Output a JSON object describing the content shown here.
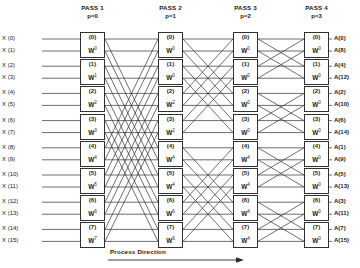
{
  "figure": {
    "caption": "Process Direction",
    "w_symbol": "W"
  },
  "passes": [
    {
      "name": "PASS 1",
      "index_label": "p=0",
      "boxes": [
        {
          "label": "(0)",
          "w_exp": "0"
        },
        {
          "label": "(1)",
          "w_exp": "1"
        },
        {
          "label": "(2)",
          "w_exp": "2"
        },
        {
          "label": "(3)",
          "w_exp": "3"
        },
        {
          "label": "(4)",
          "w_exp": "4"
        },
        {
          "label": "(5)",
          "w_exp": "5"
        },
        {
          "label": "(6)",
          "w_exp": "6"
        },
        {
          "label": "(7)",
          "w_exp": "7"
        }
      ]
    },
    {
      "name": "PASS 2",
      "index_label": "p=1",
      "boxes": [
        {
          "label": "(0)",
          "w_exp": "0"
        },
        {
          "label": "(1)",
          "w_exp": "0"
        },
        {
          "label": "(2)",
          "w_exp": "2"
        },
        {
          "label": "(3)",
          "w_exp": "2"
        },
        {
          "label": "(4)",
          "w_exp": "4"
        },
        {
          "label": "(5)",
          "w_exp": "4"
        },
        {
          "label": "(6)",
          "w_exp": "6"
        },
        {
          "label": "(7)",
          "w_exp": "6"
        }
      ]
    },
    {
      "name": "PASS 3",
      "index_label": "p=2",
      "boxes": [
        {
          "label": "(0)",
          "w_exp": "0"
        },
        {
          "label": "(1)",
          "w_exp": "0"
        },
        {
          "label": "(2)",
          "w_exp": "0"
        },
        {
          "label": "(3)",
          "w_exp": "0"
        },
        {
          "label": "(4)",
          "w_exp": "4"
        },
        {
          "label": "(5)",
          "w_exp": "4"
        },
        {
          "label": "(6)",
          "w_exp": "4"
        },
        {
          "label": "(7)",
          "w_exp": "4"
        }
      ]
    },
    {
      "name": "PASS 4",
      "index_label": "p=3",
      "boxes": [
        {
          "label": "(0)",
          "w_exp": "0"
        },
        {
          "label": "(1)",
          "w_exp": "0"
        },
        {
          "label": "(2)",
          "w_exp": "0"
        },
        {
          "label": "(3)",
          "w_exp": "0"
        },
        {
          "label": "(4)",
          "w_exp": "0"
        },
        {
          "label": "(5)",
          "w_exp": "0"
        },
        {
          "label": "(6)",
          "w_exp": "0"
        },
        {
          "label": "(7)",
          "w_exp": "0"
        }
      ]
    }
  ],
  "inputs": [
    "X (0)",
    "X (1)",
    "X (2)",
    "X (3)",
    "X (4)",
    "X (5)",
    "X (6)",
    "X (7)",
    "X (8)",
    "X (9)",
    "X (10)",
    "X (11)",
    "X (12)",
    "X (13)",
    "X (14)",
    "X (15)"
  ],
  "outputs": [
    "A(0)",
    "A(8)",
    "A(4)",
    "A(12)",
    "A(2)",
    "A(10)",
    "A(6)",
    "A(14)",
    "A(1)",
    "A(9)",
    "A(5)",
    "A(13)",
    "A(3)",
    "A(11)",
    "A(7)",
    "A(15)"
  ],
  "chart_data": {
    "type": "diagram",
    "n_points": 16,
    "n_passes": 4,
    "pass_strides": [
      8,
      4,
      2,
      1
    ],
    "twiddle_exponents": [
      [
        0,
        1,
        2,
        3,
        4,
        5,
        6,
        7
      ],
      [
        0,
        0,
        2,
        2,
        4,
        4,
        6,
        6
      ],
      [
        0,
        0,
        0,
        0,
        4,
        4,
        4,
        4
      ],
      [
        0,
        0,
        0,
        0,
        0,
        0,
        0,
        0
      ]
    ],
    "input_order": [
      0,
      1,
      2,
      3,
      4,
      5,
      6,
      7,
      8,
      9,
      10,
      11,
      12,
      13,
      14,
      15
    ],
    "output_order": [
      0,
      8,
      4,
      12,
      2,
      10,
      6,
      14,
      1,
      9,
      5,
      13,
      3,
      11,
      7,
      15
    ]
  }
}
